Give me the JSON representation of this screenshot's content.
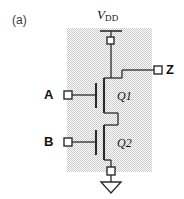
{
  "figure": {
    "panel_label": "(a)",
    "colors": {
      "line": "#2b2b2b",
      "shade_fill": "#d9d9d9",
      "background": "#ffffff",
      "terminal_fill": "#ffffff"
    }
  },
  "labels": {
    "supply": "V",
    "supply_subscript": "DD",
    "input_a": "A",
    "input_b": "B",
    "output_z": "Z",
    "transistor_1": "Q1",
    "transistor_2": "Q2"
  },
  "terminals": [
    {
      "name": "vdd-terminal",
      "label": "VDD",
      "x": 111,
      "y": 40
    },
    {
      "name": "input-a-terminal",
      "label": "A",
      "x": 64,
      "y": 95
    },
    {
      "name": "input-b-terminal",
      "label": "B",
      "x": 64,
      "y": 142
    },
    {
      "name": "output-z-terminal",
      "label": "Z",
      "x": 158,
      "y": 70
    },
    {
      "name": "ground-terminal",
      "label": "GND",
      "x": 111,
      "y": 171
    }
  ],
  "devices": [
    {
      "name": "transistor-q1",
      "label": "Q1",
      "type": "nmos",
      "gate_input": "A"
    },
    {
      "name": "transistor-q2",
      "label": "Q2",
      "type": "nmos",
      "gate_input": "B"
    }
  ],
  "shaded_region": {
    "x": 67,
    "y": 28,
    "width": 85,
    "height": 144
  }
}
